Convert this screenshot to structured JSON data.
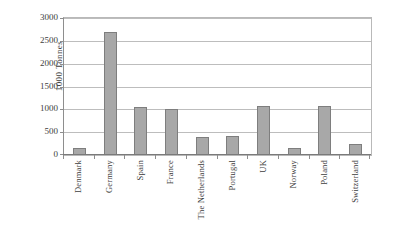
{
  "chart_data": {
    "type": "bar",
    "title": "",
    "subtitle": "",
    "xlabel": "",
    "ylabel": "1000 Tonnes",
    "ylim": [
      0,
      3000
    ],
    "ytick_step": 500,
    "yticks": [
      3000,
      2500,
      2000,
      1500,
      1000,
      500,
      0
    ],
    "ytick_labels": [
      "3000",
      "2500",
      "2000",
      "1500",
      "1000",
      "500",
      "0"
    ],
    "grid": true,
    "grid_axis": "y",
    "legend": false,
    "legend_position": "none",
    "bar_fill_color": "#a8a8a8",
    "bar_border_color": "#7e7e7e",
    "axis_color": "#8e8e8e",
    "gridline_color": "#bdbdbd",
    "background_color": "#ffffff",
    "categories": [
      "Denmark",
      "Germany",
      "Spain",
      "France",
      "The Netherlands",
      "Portugal",
      "UK",
      "Norway",
      "Poland",
      "Switzerland"
    ],
    "values": [
      150,
      2700,
      1060,
      1010,
      390,
      420,
      1080,
      150,
      1070,
      240
    ]
  }
}
